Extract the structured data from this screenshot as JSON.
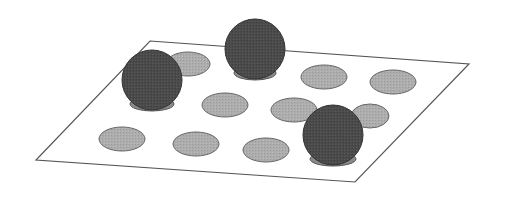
{
  "diagram": {
    "colors": {
      "background": "#ffffff",
      "plane_fill": "#ffffff",
      "plane_stroke": "#555555",
      "disc_fill": "#a9a9a9",
      "disc_stroke": "#666666",
      "sphere_fill": "#4a4a4a",
      "sphere_stroke": "#333333",
      "sphere_base_fill": "#8a8a8a"
    },
    "plane": {
      "points": "150,41 469,64 355,182 36,160"
    },
    "discs": [
      {
        "cx": 188,
        "cy": 64,
        "rx": 22,
        "ry": 12
      },
      {
        "cx": 225,
        "cy": 105,
        "rx": 23,
        "ry": 12
      },
      {
        "cx": 122,
        "cy": 139,
        "rx": 23,
        "ry": 12
      },
      {
        "cx": 196,
        "cy": 144,
        "rx": 23,
        "ry": 12
      },
      {
        "cx": 324,
        "cy": 77,
        "rx": 23,
        "ry": 12
      },
      {
        "cx": 393,
        "cy": 82,
        "rx": 23,
        "ry": 12
      },
      {
        "cx": 294,
        "cy": 110,
        "rx": 23,
        "ry": 12
      },
      {
        "cx": 370,
        "cy": 116,
        "rx": 19,
        "ry": 12
      },
      {
        "cx": 266,
        "cy": 150,
        "rx": 23,
        "ry": 12
      }
    ],
    "spheres": [
      {
        "cx": 152,
        "cy": 80,
        "r": 30,
        "base_cx": 152,
        "base_cy": 104,
        "base_rx": 22,
        "base_ry": 7
      },
      {
        "cx": 255,
        "cy": 49,
        "r": 30,
        "base_cx": 255,
        "base_cy": 73,
        "base_rx": 21,
        "base_ry": 7
      },
      {
        "cx": 333,
        "cy": 135,
        "r": 30,
        "base_cx": 333,
        "base_cy": 159,
        "base_rx": 23,
        "base_ry": 7
      }
    ]
  }
}
